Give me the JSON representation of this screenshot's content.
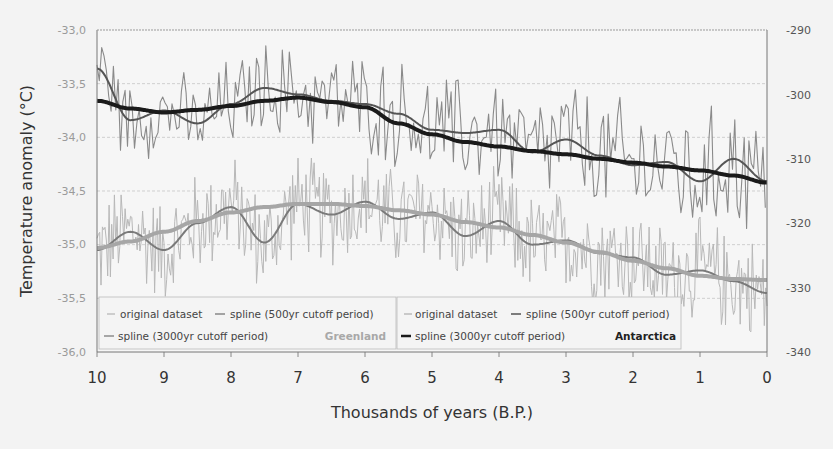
{
  "chart_data": {
    "type": "line",
    "title": "",
    "xlabel": "Thousands of years (B.P.)",
    "ylabel": "Temperature anomaly (°C)",
    "y2label": "",
    "xlim": [
      10,
      0
    ],
    "ylim": [
      -36.0,
      -33.0
    ],
    "y2lim": [
      -340,
      -290
    ],
    "x_ticks": [
      "10",
      "9",
      "8",
      "7",
      "6",
      "5",
      "4",
      "3",
      "2",
      "1",
      "0"
    ],
    "y_ticks_left": [
      "-33,0",
      "-33,5",
      "-34,0",
      "-34,5",
      "-35,0",
      "-35,5",
      "-36,0"
    ],
    "y_ticks_right": [
      "-290",
      "-300",
      "-310",
      "-320",
      "-330",
      "-340"
    ],
    "grid": true,
    "legend_position": "bottom-inside",
    "x": [
      10,
      9.5,
      9,
      8.5,
      8,
      7.5,
      7,
      6.5,
      6,
      5.5,
      5,
      4.5,
      4,
      3.5,
      3,
      2.5,
      2,
      1.5,
      1,
      0.5,
      0
    ],
    "series": [
      {
        "name": "Greenland spline (3000yr cutoff period)",
        "axis": "left",
        "color": "#a6a6a6",
        "values": [
          -35.03,
          -34.97,
          -34.88,
          -34.78,
          -34.7,
          -34.65,
          -34.62,
          -34.62,
          -34.64,
          -34.68,
          -34.72,
          -34.79,
          -34.84,
          -34.91,
          -34.98,
          -35.07,
          -35.15,
          -35.22,
          -35.29,
          -35.32,
          -35.33
        ]
      },
      {
        "name": "Greenland spline (500yr cutoff period)",
        "axis": "left",
        "color": "#7a7a7a",
        "values": [
          -35.05,
          -34.88,
          -35.05,
          -34.8,
          -34.65,
          -34.98,
          -34.62,
          -34.72,
          -34.6,
          -34.76,
          -34.7,
          -34.92,
          -34.78,
          -35.0,
          -34.96,
          -35.08,
          -35.12,
          -35.28,
          -35.24,
          -35.34,
          -35.45
        ]
      },
      {
        "name": "Antarctica spline (3000yr cutoff period)",
        "axis": "right",
        "color": "#1a1a1a",
        "values": [
          -301.0,
          -302.2,
          -302.8,
          -302.4,
          -301.8,
          -301.0,
          -300.5,
          -301.2,
          -302.0,
          -304.5,
          -306.2,
          -307.4,
          -308.1,
          -308.8,
          -309.3,
          -310.0,
          -310.6,
          -311.2,
          -311.8,
          -312.6,
          -313.7
        ]
      },
      {
        "name": "Antarctica spline (500yr cutoff period)",
        "axis": "right",
        "color": "#555555",
        "values": [
          -296.0,
          -304.0,
          -302.5,
          -304.5,
          -301.5,
          -299.0,
          -300.0,
          -301.0,
          -301.5,
          -303.0,
          -305.5,
          -306.0,
          -305.5,
          -309.0,
          -307.0,
          -309.5,
          -311.0,
          -310.5,
          -313.5,
          -310.0,
          -313.5
        ]
      },
      {
        "name": "Greenland original dataset",
        "axis": "left",
        "color": "#b8b8b8",
        "values": "high-frequency noisy series around Greenland spline"
      },
      {
        "name": "Antarctica original dataset",
        "axis": "right",
        "color": "#8a8a8a",
        "values": "high-frequency noisy series around Antarctica spline"
      }
    ]
  },
  "legend": {
    "greenland": {
      "original": "original dataset",
      "spline500": "spline (500yr cutoff period)",
      "spline3000": "spline (3000yr cutoff period)",
      "title": "Greenland"
    },
    "antarctica": {
      "original": "original dataset",
      "spline500": "spline (500yr cutoff period)",
      "spline3000": "spline (3000yr cutoff period)",
      "title": "Antarctica"
    }
  },
  "axes": {
    "xlabel": "Thousands of years (B.P.)",
    "ylabel": "Temperature anomaly (°C)",
    "x_ticks": [
      "10",
      "9",
      "8",
      "7",
      "6",
      "5",
      "4",
      "3",
      "2",
      "1",
      "0"
    ],
    "y_left": [
      "-33,0",
      "-33,5",
      "-34,0",
      "-34,5",
      "-35,0",
      "-35,5",
      "-36,0"
    ],
    "y_right": [
      "-290",
      "-300",
      "-310",
      "-320",
      "-330",
      "-340"
    ]
  }
}
